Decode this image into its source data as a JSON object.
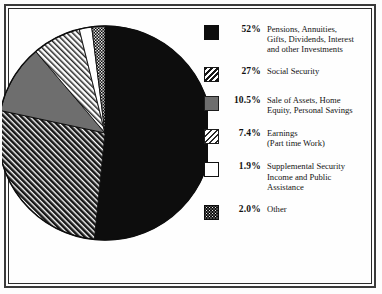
{
  "chart_data": {
    "type": "pie",
    "title": "",
    "subtitle": "",
    "xlabel": "",
    "ylabel": "",
    "legend_position": "right",
    "grid": false,
    "start_angle_deg": 0,
    "direction": "clockwise",
    "categories": [
      "Pensions, Annuities, Gifts, Dividends, Interest and other Investments",
      "Social Security",
      "Sale of Assets, Home Equity, Personal Savings",
      "Earnings (Part time Work)",
      "Supplemental Security Income and Public Assistance",
      "Other"
    ],
    "values": [
      52,
      27,
      10.5,
      7.4,
      1.9,
      2.0
    ],
    "value_labels": [
      "52%",
      "27%",
      "10.5%",
      "7.4%",
      "1.9%",
      "2.0%"
    ],
    "slices": [
      {
        "label": "Pensions, Annuities, Gifts, Dividends, Interest and other Investments",
        "value": 52,
        "value_label": "52%",
        "fill": "solid-black",
        "color": "#0d0d0d"
      },
      {
        "label": "Social Security",
        "value": 27,
        "value_label": "27%",
        "fill": "dark-diagonal-hatch",
        "color": "#4a4a4a"
      },
      {
        "label": "Sale of Assets, Home Equity, Personal Savings",
        "value": 10.5,
        "value_label": "10.5%",
        "fill": "medium-gray",
        "color": "#7d7d7d"
      },
      {
        "label": "Earnings (Part time Work)",
        "value": 7.4,
        "value_label": "7.4%",
        "fill": "light-diagonal-hatch",
        "color": "#cfcfcf"
      },
      {
        "label": "Supplemental Security Income and Public Assistance",
        "value": 1.9,
        "value_label": "1.9%",
        "fill": "white",
        "color": "#ffffff"
      },
      {
        "label": "Other",
        "value": 2.0,
        "value_label": "2.0%",
        "fill": "checker-dots",
        "color": "#1a1a1a"
      }
    ]
  },
  "legend": {
    "items": [
      {
        "percent": "52%",
        "swatch": "solid-black-swatch",
        "lines": [
          "Pensions, Annuities,",
          "Gifts, Dividends, Interest",
          "and other Investments"
        ]
      },
      {
        "percent": "27%",
        "swatch": "dark-hatch-swatch",
        "lines": [
          "Social Security"
        ]
      },
      {
        "percent": "10.5%",
        "swatch": "gray-swatch",
        "lines": [
          "Sale of Assets, Home",
          "Equity, Personal Savings"
        ]
      },
      {
        "percent": "7.4%",
        "swatch": "light-hatch-swatch",
        "lines": [
          "Earnings",
          "(Part time Work)"
        ]
      },
      {
        "percent": "1.9%",
        "swatch": "white-swatch",
        "lines": [
          "Supplemental Security",
          "Income and Public",
          "Assistance"
        ]
      },
      {
        "percent": "2.0%",
        "swatch": "checker-swatch",
        "lines": [
          "Other"
        ]
      }
    ]
  },
  "colors": {
    "frame": "#3a3a3a",
    "background": "#fefefe",
    "text": "#141414"
  }
}
